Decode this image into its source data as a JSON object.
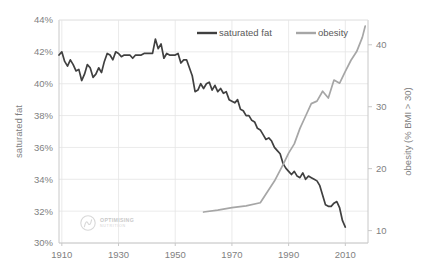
{
  "chart_data": {
    "type": "line",
    "title": "",
    "xlabel": "",
    "ylabel": "saturated fat",
    "y2label": "obesity (% BMI > 30)",
    "grid": true,
    "legend_position": "top-center",
    "xlim": [
      1909,
      2018
    ],
    "xticks": [
      1910,
      1930,
      1950,
      1970,
      1990,
      2010
    ],
    "xtick_labels": [
      "1910",
      "1930",
      "1950",
      "1970",
      "1990",
      "2010"
    ],
    "ylim": [
      30,
      44
    ],
    "yticks": [
      30,
      32,
      34,
      36,
      38,
      40,
      42,
      44
    ],
    "ytick_labels": [
      "30%",
      "32%",
      "34%",
      "36%",
      "38%",
      "40%",
      "42%",
      "44%"
    ],
    "y2lim": [
      8,
      44
    ],
    "y2ticks": [
      10,
      20,
      30,
      40
    ],
    "y2tick_labels": [
      "10",
      "20",
      "30",
      "40"
    ],
    "series": [
      {
        "name": "saturated fat",
        "axis": "left",
        "color": "#404040",
        "unit": "%",
        "x": [
          1909,
          1910,
          1911,
          1912,
          1913,
          1914,
          1915,
          1916,
          1917,
          1918,
          1919,
          1920,
          1921,
          1922,
          1923,
          1924,
          1925,
          1926,
          1927,
          1928,
          1929,
          1930,
          1931,
          1932,
          1933,
          1934,
          1935,
          1936,
          1937,
          1938,
          1939,
          1940,
          1941,
          1942,
          1943,
          1944,
          1945,
          1946,
          1947,
          1948,
          1949,
          1950,
          1951,
          1952,
          1953,
          1954,
          1955,
          1956,
          1957,
          1958,
          1959,
          1960,
          1961,
          1962,
          1963,
          1964,
          1965,
          1966,
          1967,
          1968,
          1969,
          1970,
          1971,
          1972,
          1973,
          1974,
          1975,
          1976,
          1977,
          1978,
          1979,
          1980,
          1981,
          1982,
          1983,
          1984,
          1985,
          1986,
          1987,
          1988,
          1989,
          1990,
          1991,
          1992,
          1993,
          1994,
          1995,
          1996,
          1997,
          1998,
          1999,
          2000,
          2001,
          2002,
          2003,
          2004,
          2005,
          2006,
          2007,
          2008,
          2009,
          2010
        ],
        "values": [
          41.8,
          42.0,
          41.4,
          41.1,
          41.5,
          41.2,
          40.8,
          40.9,
          40.2,
          40.6,
          41.2,
          41.0,
          40.4,
          40.6,
          41.0,
          40.7,
          41.4,
          41.9,
          41.8,
          41.5,
          42.0,
          41.9,
          41.7,
          41.8,
          41.8,
          41.8,
          41.6,
          41.8,
          41.8,
          41.8,
          41.9,
          41.9,
          41.9,
          41.9,
          42.8,
          42.2,
          42.5,
          41.6,
          41.9,
          41.8,
          41.8,
          41.8,
          41.9,
          41.3,
          41.5,
          41.5,
          41.0,
          40.5,
          39.5,
          39.6,
          40.0,
          39.7,
          40.0,
          40.1,
          39.6,
          39.9,
          39.5,
          39.7,
          39.4,
          39.5,
          39.0,
          38.9,
          38.8,
          39.0,
          38.4,
          38.3,
          38.0,
          38.0,
          37.7,
          37.6,
          37.2,
          37.1,
          36.8,
          36.5,
          36.6,
          36.4,
          36.0,
          35.8,
          35.6,
          35.0,
          34.7,
          34.5,
          34.3,
          34.5,
          34.2,
          34.1,
          34.4,
          34.0,
          34.2,
          34.1,
          34.0,
          33.9,
          33.6,
          33.0,
          32.4,
          32.3,
          32.3,
          32.5,
          32.6,
          32.2,
          31.4,
          31.0
        ],
        "start_value": 41.8,
        "end_value": 31.0,
        "peak_value": 42.8,
        "min_value": 31.0
      },
      {
        "name": "obesity",
        "axis": "right",
        "color": "#a6a6a6",
        "unit": "% BMI > 30",
        "x": [
          1960,
          1965,
          1970,
          1975,
          1980,
          1985,
          1988,
          1990,
          1992,
          1994,
          1996,
          1998,
          2000,
          2002,
          2004,
          2006,
          2008,
          2010,
          2012,
          2014,
          2016,
          2017
        ],
        "values": [
          13.0,
          13.3,
          13.7,
          14.0,
          14.5,
          18.0,
          20.6,
          22.5,
          24.0,
          26.5,
          28.5,
          30.5,
          30.9,
          32.5,
          31.4,
          34.3,
          33.8,
          35.7,
          37.5,
          38.9,
          41.2,
          43.0
        ],
        "start_value": 13.0,
        "end_value": 43.0
      }
    ],
    "legend": [
      {
        "label": "saturated fat",
        "color": "#404040"
      },
      {
        "label": "obesity",
        "color": "#a6a6a6"
      }
    ],
    "annotations": {
      "crossover_year": 1990,
      "crossover_note": "lines cross near 1990"
    }
  },
  "watermark": {
    "line1": "OPTIMISING",
    "line2": "NUTRITION"
  }
}
